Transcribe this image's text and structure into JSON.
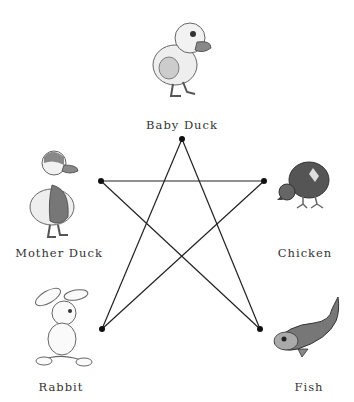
{
  "diagram": {
    "nodes": [
      {
        "id": "baby_duck",
        "label": "Baby Duck",
        "icon": "baby-duck-icon",
        "x": 182,
        "y": 139
      },
      {
        "id": "mother_duck",
        "label": "Mother Duck",
        "icon": "mother-duck-icon",
        "x": 101,
        "y": 181
      },
      {
        "id": "chicken",
        "label": "Chicken",
        "icon": "chicken-icon",
        "x": 264,
        "y": 181
      },
      {
        "id": "rabbit",
        "label": "Rabbit",
        "icon": "rabbit-icon",
        "x": 102,
        "y": 329
      },
      {
        "id": "fish",
        "label": "Fish",
        "icon": "fish-icon",
        "x": 260,
        "y": 329
      }
    ],
    "edges": [
      [
        "baby_duck",
        "rabbit"
      ],
      [
        "baby_duck",
        "fish"
      ],
      [
        "mother_duck",
        "chicken"
      ],
      [
        "mother_duck",
        "fish"
      ],
      [
        "chicken",
        "rabbit"
      ]
    ],
    "shape": "five-pointed star",
    "line_color": "#222222"
  }
}
